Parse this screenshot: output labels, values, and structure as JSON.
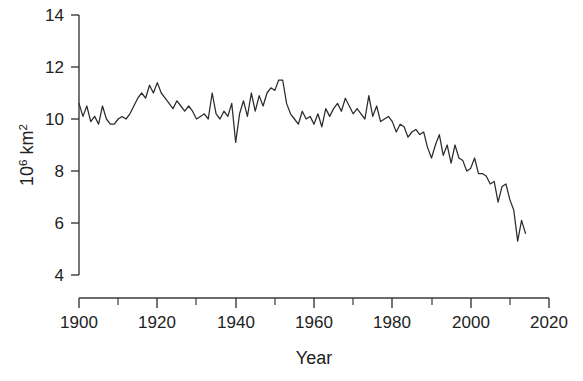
{
  "chart_data": {
    "type": "line",
    "title": "",
    "xlabel": "Year",
    "ylabel": "10^6 km^2",
    "ylabel_base": "10",
    "ylabel_exponent": "6",
    "ylabel_unit": " km",
    "ylabel_unit_exponent": "2",
    "xlim": [
      1900,
      2020
    ],
    "ylim": [
      4,
      14
    ],
    "xticks": [
      1900,
      1920,
      1940,
      1960,
      1980,
      2000,
      2020
    ],
    "xticks_minor": [
      1910,
      1930,
      1950,
      1970,
      1990,
      2010
    ],
    "yticks": [
      4,
      6,
      8,
      10,
      12,
      14
    ],
    "grid": false,
    "legend": null,
    "line_color": "#2b2b2b",
    "series": [
      {
        "name": "Arctic sea ice extent",
        "x": [
          1900,
          1901,
          1902,
          1903,
          1904,
          1905,
          1906,
          1907,
          1908,
          1909,
          1910,
          1911,
          1912,
          1913,
          1914,
          1915,
          1916,
          1917,
          1918,
          1919,
          1920,
          1921,
          1922,
          1923,
          1924,
          1925,
          1926,
          1927,
          1928,
          1929,
          1930,
          1931,
          1932,
          1933,
          1934,
          1935,
          1936,
          1937,
          1938,
          1939,
          1940,
          1941,
          1942,
          1943,
          1944,
          1945,
          1946,
          1947,
          1948,
          1949,
          1950,
          1951,
          1952,
          1953,
          1954,
          1955,
          1956,
          1957,
          1958,
          1959,
          1960,
          1961,
          1962,
          1963,
          1964,
          1965,
          1966,
          1967,
          1968,
          1969,
          1970,
          1971,
          1972,
          1973,
          1974,
          1975,
          1976,
          1977,
          1978,
          1979,
          1980,
          1981,
          1982,
          1983,
          1984,
          1985,
          1986,
          1987,
          1988,
          1989,
          1990,
          1991,
          1992,
          1993,
          1994,
          1995,
          1996,
          1997,
          1998,
          1999,
          2000,
          2001,
          2002,
          2003,
          2004,
          2005,
          2006,
          2007,
          2008,
          2009,
          2010,
          2011,
          2012,
          2013,
          2014
        ],
        "values": [
          10.6,
          10.1,
          10.5,
          9.9,
          10.1,
          9.8,
          10.5,
          10.0,
          9.8,
          9.8,
          10.0,
          10.1,
          10.0,
          10.2,
          10.5,
          10.8,
          11.0,
          10.8,
          11.3,
          11.0,
          11.4,
          11.0,
          10.8,
          10.6,
          10.4,
          10.7,
          10.5,
          10.3,
          10.5,
          10.3,
          10.0,
          10.1,
          10.2,
          10.0,
          11.0,
          10.2,
          10.0,
          10.3,
          10.1,
          10.6,
          9.1,
          10.2,
          10.7,
          10.1,
          11.0,
          10.3,
          10.9,
          10.5,
          11.0,
          11.2,
          11.1,
          11.5,
          11.5,
          10.6,
          10.2,
          10.0,
          9.8,
          10.3,
          10.0,
          10.1,
          9.8,
          10.2,
          9.7,
          10.4,
          10.1,
          10.4,
          10.6,
          10.3,
          10.8,
          10.5,
          10.2,
          10.4,
          10.2,
          10.0,
          10.9,
          10.1,
          10.5,
          9.9,
          10.0,
          10.1,
          9.9,
          9.5,
          9.8,
          9.7,
          9.3,
          9.5,
          9.6,
          9.4,
          9.5,
          8.9,
          8.5,
          9.0,
          9.4,
          8.6,
          9.0,
          8.3,
          9.0,
          8.5,
          8.4,
          8.0,
          8.1,
          8.5,
          7.9,
          7.9,
          7.8,
          7.5,
          7.6,
          6.8,
          7.4,
          7.5,
          6.9,
          6.5,
          5.3,
          6.1,
          5.6
        ]
      }
    ]
  },
  "axis": {
    "x_tick_labels": [
      "1900",
      "1920",
      "1940",
      "1960",
      "1980",
      "2000",
      "2020"
    ],
    "y_tick_labels": [
      "4",
      "6",
      "8",
      "10",
      "12",
      "14"
    ],
    "x_axis_title": "Year"
  }
}
